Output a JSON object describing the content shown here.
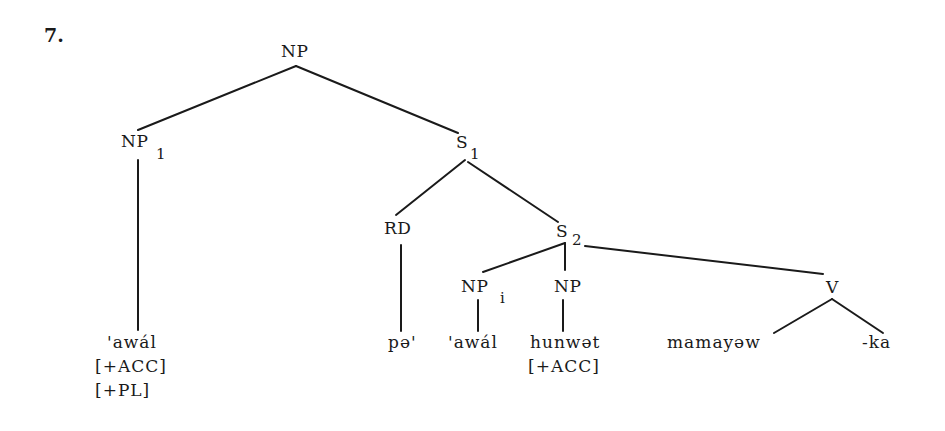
{
  "example_number": "7.",
  "tree": {
    "root": {
      "label": "NP",
      "subscript": ""
    },
    "np1": {
      "label": "NP",
      "subscript": "1"
    },
    "s1": {
      "label": "S",
      "subscript": "1"
    },
    "rd": {
      "label": "RD",
      "subscript": ""
    },
    "s2": {
      "label": "S",
      "subscript": "2"
    },
    "np_i": {
      "label": "NP",
      "subscript": "i"
    },
    "np_obj": {
      "label": "NP",
      "subscript": ""
    },
    "v": {
      "label": "V",
      "subscript": ""
    }
  },
  "leaves": {
    "np1_word": "'awál",
    "np1_features": [
      "[+ACC]",
      "[+PL]"
    ],
    "rd_word": "pə'",
    "np_i_word": "'awál",
    "np_obj_word": "hunwət",
    "np_obj_features": [
      "[+ACC]"
    ],
    "v_stem": "mamayəw",
    "v_suffix": "-ka"
  },
  "colors": {
    "ink": "#1a1a1a",
    "background": "#ffffff"
  }
}
